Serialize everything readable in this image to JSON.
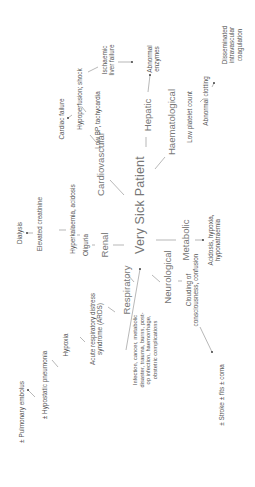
{
  "diagram": {
    "center": "Very Sick Patient",
    "cause": "Infection, cancer, metabolic\ndisaster, trauma, burns, post-\nop infection, haemorrhage,\nobstetric complications",
    "systems": {
      "renal": {
        "label": "Renal",
        "chain": [
          "Oliguria",
          "Hyperkalaemia, acidosis",
          "Elevated creatinine",
          "Dialysis"
        ]
      },
      "cardiovascular": {
        "label": "Cardiovascular",
        "chain": [
          "Low BP, tachycardia",
          "Hypoperfusion; shock",
          "Cardiac failure"
        ],
        "branch": "Ischaemic\nliver failure"
      },
      "hepatic": {
        "label": "Hepatic",
        "chain": [
          "Abnormal\nenzymes"
        ]
      },
      "haematological": {
        "label": "Haematological",
        "chain": [
          "Low platelet count",
          "Abnormal clotting",
          "Disseminated\nintravascular\ncoagulation"
        ]
      },
      "metabolic": {
        "label": "Metabolic",
        "chain": [
          "Acidosis, hypoxia,\nhyponatraemia"
        ]
      },
      "respiratory": {
        "label": "Respiratory",
        "chain": [
          "Acute respiratory distress\nsyndrome (ARDS)",
          "Hypoxia",
          "± Hypostatic pneumonia",
          "± Pulmonary embolus"
        ]
      },
      "neurological": {
        "label": "Neurological",
        "chain": [
          "Clouding of\nconsciousness, confusion",
          "± Stroke ± fits ± coma"
        ]
      }
    }
  }
}
